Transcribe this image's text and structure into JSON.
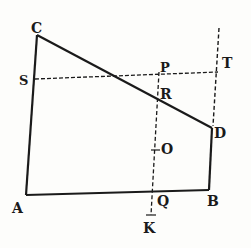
{
  "diagram": {
    "title": "",
    "type": "geometric figure",
    "points": {
      "A": {
        "label": "A",
        "x": 26,
        "y": 195
      },
      "B": {
        "label": "B",
        "x": 209,
        "y": 190
      },
      "C": {
        "label": "C",
        "x": 37,
        "y": 35
      },
      "D": {
        "label": "D",
        "x": 212,
        "y": 128
      },
      "S": {
        "label": "S",
        "x": 35,
        "y": 79
      },
      "T": {
        "label": "T",
        "x": 218,
        "y": 72
      },
      "P": {
        "label": "P",
        "x": 159,
        "y": 74
      },
      "R": {
        "label": "R",
        "x": 158,
        "y": 97
      },
      "O": {
        "label": "O",
        "x": 156,
        "y": 150
      },
      "Q": {
        "label": "Q",
        "x": 153,
        "y": 192
      },
      "K": {
        "label": "K",
        "x": 151,
        "y": 214
      }
    },
    "solid_lines": [
      "AC",
      "CD",
      "DB",
      "BA"
    ],
    "dashed_lines": [
      "ST",
      "PK",
      "T-vertical"
    ],
    "colors": {
      "ink": "#1a1a1a",
      "paper": "#fdfdfb"
    }
  }
}
